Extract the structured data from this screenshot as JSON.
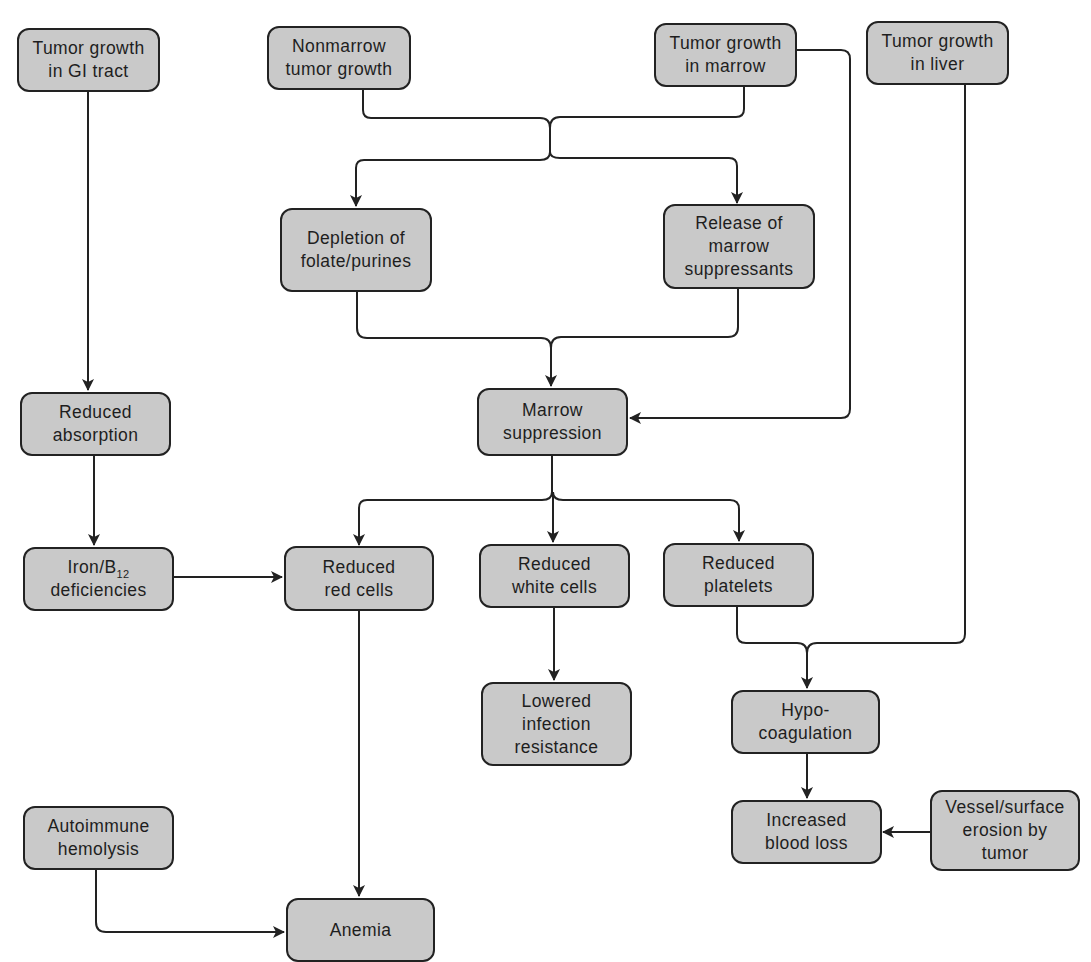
{
  "diagram": {
    "type": "flowchart",
    "colors": {
      "box_fill": "#c9c9c9",
      "box_border": "#222222",
      "line": "#222222",
      "background": "#ffffff"
    },
    "nodes": {
      "gi_tract": {
        "label": "Tumor growth\nin GI tract"
      },
      "nonmarrow": {
        "label": "Nonmarrow\ntumor growth"
      },
      "marrow_tumor": {
        "label": "Tumor growth\nin marrow"
      },
      "liver": {
        "label": "Tumor growth\nin liver"
      },
      "depletion": {
        "label": "Depletion of\nfolate/purines"
      },
      "release": {
        "label": "Release of\nmarrow\nsuppressants"
      },
      "absorption": {
        "label": "Reduced\nabsorption"
      },
      "marrow_suppression": {
        "label": "Marrow\nsuppression"
      },
      "iron_b12": {
        "label_pre": "Iron/B",
        "label_sub": "12",
        "label_post": "deficiencies"
      },
      "red_cells": {
        "label": "Reduced\nred cells"
      },
      "white_cells": {
        "label": "Reduced\nwhite cells"
      },
      "platelets": {
        "label": "Reduced\nplatelets"
      },
      "infection": {
        "label": "Lowered\ninfection\nresistance"
      },
      "hypocoagulation": {
        "label": "Hypo-\ncoagulation"
      },
      "blood_loss": {
        "label": "Increased\nblood loss"
      },
      "vessel_erosion": {
        "label": "Vessel/surface\nerosion by\ntumor"
      },
      "autoimmune": {
        "label": "Autoimmune\nhemolysis"
      },
      "anemia": {
        "label": "Anemia"
      }
    },
    "edges": [
      {
        "from": "Tumor growth in GI tract",
        "to": "Reduced absorption"
      },
      {
        "from": "Reduced absorption",
        "to": "Iron/B12 deficiencies"
      },
      {
        "from": "Iron/B12 deficiencies",
        "to": "Reduced red cells"
      },
      {
        "from": "Nonmarrow tumor growth",
        "to": "Depletion of folate/purines"
      },
      {
        "from": "Nonmarrow tumor growth",
        "to": "Release of marrow suppressants"
      },
      {
        "from": "Tumor growth in marrow",
        "to": "Depletion of folate/purines"
      },
      {
        "from": "Tumor growth in marrow",
        "to": "Release of marrow suppressants"
      },
      {
        "from": "Tumor growth in marrow",
        "to": "Marrow suppression"
      },
      {
        "from": "Depletion of folate/purines",
        "to": "Marrow suppression"
      },
      {
        "from": "Release of marrow suppressants",
        "to": "Marrow suppression"
      },
      {
        "from": "Marrow suppression",
        "to": "Reduced red cells"
      },
      {
        "from": "Marrow suppression",
        "to": "Reduced white cells"
      },
      {
        "from": "Marrow suppression",
        "to": "Reduced platelets"
      },
      {
        "from": "Reduced white cells",
        "to": "Lowered infection resistance"
      },
      {
        "from": "Reduced platelets",
        "to": "Hypo-coagulation"
      },
      {
        "from": "Tumor growth in liver",
        "to": "Hypo-coagulation"
      },
      {
        "from": "Hypo-coagulation",
        "to": "Increased blood loss"
      },
      {
        "from": "Vessel/surface erosion by tumor",
        "to": "Increased blood loss"
      },
      {
        "from": "Reduced red cells",
        "to": "Anemia"
      },
      {
        "from": "Autoimmune hemolysis",
        "to": "Anemia"
      }
    ]
  }
}
